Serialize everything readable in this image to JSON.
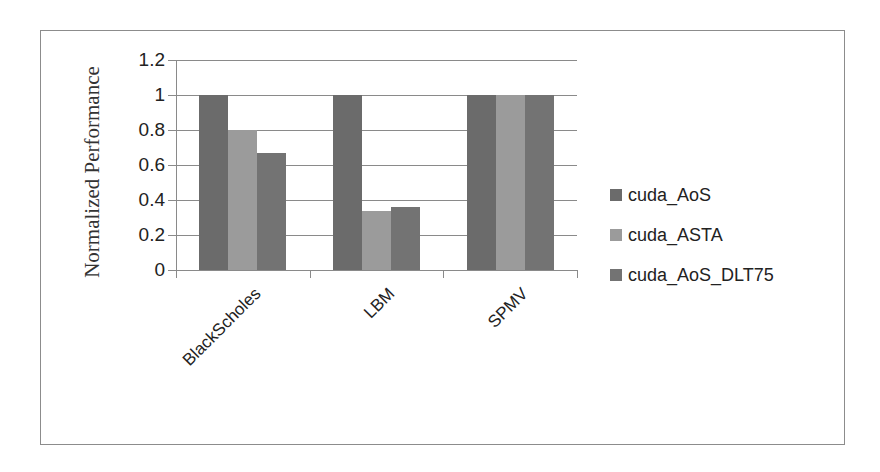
{
  "chart_data": {
    "type": "bar",
    "title": "",
    "xlabel": "",
    "ylabel": "Normalized Performance",
    "ylim": [
      0,
      1.2
    ],
    "yticks": [
      "0",
      "0.2",
      "0.4",
      "0.6",
      "0.8",
      "1",
      "1.2"
    ],
    "grid": true,
    "legend_position": "right",
    "categories": [
      "BlackScholes",
      "LBM",
      "SPMV"
    ],
    "series": [
      {
        "name": "cuda_AoS",
        "color": "#6b6b6b",
        "values": [
          1.0,
          1.0,
          1.0
        ]
      },
      {
        "name": "cuda_ASTA",
        "color": "#9b9b9b",
        "values": [
          0.8,
          0.34,
          1.0
        ]
      },
      {
        "name": "cuda_AoS_DLT75",
        "color": "#737373",
        "values": [
          0.67,
          0.36,
          1.0
        ]
      }
    ]
  }
}
